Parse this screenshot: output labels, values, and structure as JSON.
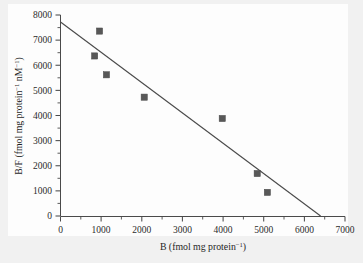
{
  "chart_data": {
    "type": "scatter",
    "title": "",
    "xlabel": "B (fmol mg protein⁻¹)",
    "ylabel": "B/F (fmol mg protein⁻¹ nM⁻¹)",
    "xlabel_parts": {
      "base": "B (fmol mg protein",
      "sup": "−1",
      "tail": ")"
    },
    "ylabel_parts": {
      "base": "B/F (fmol mg protein",
      "sup1": "−1",
      "mid": " nM",
      "sup2": "−1",
      "tail": ")"
    },
    "xlim": [
      0,
      7000
    ],
    "ylim": [
      0,
      8000
    ],
    "xticks": [
      0,
      1000,
      2000,
      3000,
      4000,
      5000,
      6000,
      7000
    ],
    "yticks": [
      0,
      1000,
      2000,
      3000,
      4000,
      5000,
      6000,
      7000,
      8000
    ],
    "xtick_labels": [
      "0",
      "1000",
      "2000",
      "3000",
      "4000",
      "5000",
      "6000",
      "7000"
    ],
    "ytick_labels": [
      "0",
      "1000",
      "2000",
      "3000",
      "4000",
      "5000",
      "6000",
      "7000",
      "8000"
    ],
    "minor_ticks": true,
    "grid": false,
    "legend": null,
    "marker_style": "filled-square",
    "marker_color": "#585858",
    "line_color": "#4b4b4b",
    "axis_color": "#4a4a4a",
    "background_color": "#fdfdfd",
    "page_color": "#f1f1f1",
    "points": [
      {
        "x": 840,
        "y": 6370
      },
      {
        "x": 960,
        "y": 7360
      },
      {
        "x": 1130,
        "y": 5620
      },
      {
        "x": 2060,
        "y": 4730
      },
      {
        "x": 3980,
        "y": 3880
      },
      {
        "x": 4840,
        "y": 1690
      },
      {
        "x": 5090,
        "y": 940
      }
    ],
    "series": [
      {
        "name": "Scatchard data",
        "x": [
          840,
          960,
          1130,
          2060,
          3980,
          4840,
          5090
        ],
        "values": [
          6370,
          7360,
          5620,
          4730,
          3880,
          1690,
          940
        ]
      }
    ],
    "fit_line": {
      "name": "linear regression",
      "x0": 0,
      "y0": 7720,
      "x1": 6400,
      "y1": 0,
      "intercept": 7720,
      "slope": -1.206,
      "x_intercept": 6400
    }
  }
}
